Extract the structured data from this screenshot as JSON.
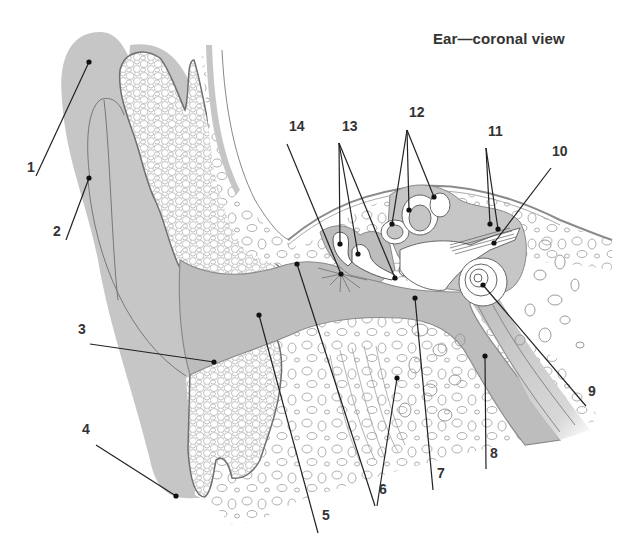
{
  "title": "Ear—coronal view",
  "colors": {
    "soft_tissue_gray": "#c4c4c4",
    "cavity_gray": "#bdbdbd",
    "bone_fill": "#ffffff",
    "outline": "#8a8a8a",
    "leader_line": "#222222",
    "label_text": "#333333"
  },
  "labels": [
    {
      "id": "1",
      "text": "1",
      "x": 27,
      "y": 172
    },
    {
      "id": "2",
      "text": "2",
      "x": 53,
      "y": 236
    },
    {
      "id": "3",
      "text": "3",
      "x": 78,
      "y": 334
    },
    {
      "id": "4",
      "text": "4",
      "x": 82,
      "y": 434
    },
    {
      "id": "5",
      "text": "5",
      "x": 322,
      "y": 520
    },
    {
      "id": "6",
      "text": "6",
      "x": 379,
      "y": 494
    },
    {
      "id": "7",
      "text": "7",
      "x": 437,
      "y": 478
    },
    {
      "id": "8",
      "text": "8",
      "x": 490,
      "y": 458
    },
    {
      "id": "9",
      "text": "9",
      "x": 588,
      "y": 396
    },
    {
      "id": "10",
      "text": "10",
      "x": 552,
      "y": 156
    },
    {
      "id": "11",
      "text": "11",
      "x": 488,
      "y": 136
    },
    {
      "id": "12",
      "text": "12",
      "x": 409,
      "y": 117
    },
    {
      "id": "13",
      "text": "13",
      "x": 342,
      "y": 131
    },
    {
      "id": "14",
      "text": "14",
      "x": 289,
      "y": 131
    }
  ],
  "leaders": [
    {
      "label": "1",
      "x1": 36,
      "y1": 176,
      "x2": 89,
      "y2": 62
    },
    {
      "label": "2",
      "x1": 66,
      "y1": 240,
      "x2": 89,
      "y2": 178
    },
    {
      "label": "3",
      "x1": 90,
      "y1": 344,
      "x2": 214,
      "y2": 362
    },
    {
      "label": "4",
      "x1": 96,
      "y1": 445,
      "x2": 176,
      "y2": 496
    },
    {
      "label": "5",
      "x1": 318,
      "y1": 533,
      "x2": 259,
      "y2": 315
    },
    {
      "label": "6a",
      "x1": 375,
      "y1": 506,
      "x2": 297,
      "y2": 264
    },
    {
      "label": "6b",
      "x1": 377,
      "y1": 506,
      "x2": 397,
      "y2": 378
    },
    {
      "label": "7",
      "x1": 433,
      "y1": 490,
      "x2": 415,
      "y2": 298
    },
    {
      "label": "8",
      "x1": 486,
      "y1": 469,
      "x2": 485,
      "y2": 356
    },
    {
      "label": "9",
      "x1": 586,
      "y1": 406,
      "x2": 483,
      "y2": 285
    },
    {
      "label": "10",
      "x1": 551,
      "y1": 168,
      "x2": 494,
      "y2": 243
    },
    {
      "label": "11a",
      "x1": 486,
      "y1": 148,
      "x2": 490,
      "y2": 224
    },
    {
      "label": "11b",
      "x1": 486,
      "y1": 148,
      "x2": 498,
      "y2": 229
    },
    {
      "label": "12a",
      "x1": 407,
      "y1": 130,
      "x2": 392,
      "y2": 224
    },
    {
      "label": "12b",
      "x1": 407,
      "y1": 130,
      "x2": 409,
      "y2": 210
    },
    {
      "label": "12c",
      "x1": 407,
      "y1": 130,
      "x2": 434,
      "y2": 197
    },
    {
      "label": "13a",
      "x1": 339,
      "y1": 143,
      "x2": 340,
      "y2": 244
    },
    {
      "label": "13b",
      "x1": 339,
      "y1": 143,
      "x2": 358,
      "y2": 254
    },
    {
      "label": "13c",
      "x1": 339,
      "y1": 143,
      "x2": 395,
      "y2": 278
    },
    {
      "label": "14",
      "x1": 287,
      "y1": 144,
      "x2": 341,
      "y2": 274
    }
  ]
}
